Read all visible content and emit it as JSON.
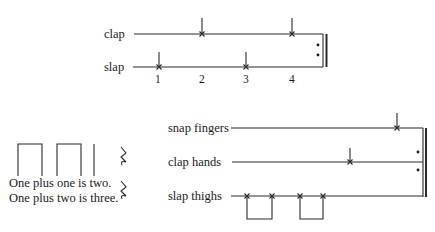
{
  "top_figure": {
    "tracks": [
      {
        "label": "clap",
        "beats": [
          2,
          4
        ]
      },
      {
        "label": "slap",
        "beats": [
          1,
          3
        ]
      }
    ],
    "beat_numbers": [
      "1",
      "2",
      "3",
      "4"
    ],
    "repeat_sign": true
  },
  "text_figure": {
    "lines": [
      "One plus one is two.",
      "One plus two is three."
    ],
    "rest_symbol": "𝄽"
  },
  "bottom_figure": {
    "tracks": [
      {
        "label": "snap fingers"
      },
      {
        "label": "clap hands"
      },
      {
        "label": "slap thighs"
      }
    ],
    "repeat_sign": true
  }
}
